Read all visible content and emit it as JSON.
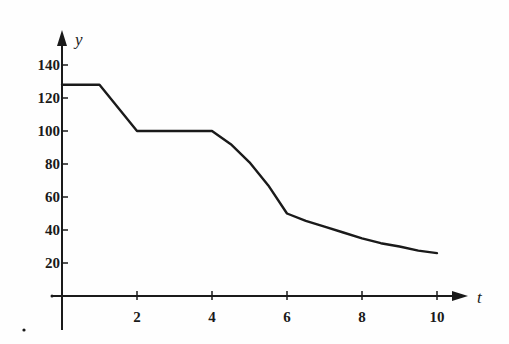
{
  "chart_data": {
    "type": "line",
    "title": "",
    "xlabel": "t",
    "ylabel": "y",
    "xlim": [
      0,
      10.5
    ],
    "ylim": [
      0,
      150
    ],
    "grid": false,
    "legend": null,
    "x_ticks": [
      2,
      4,
      6,
      8,
      10
    ],
    "y_ticks": [
      20,
      40,
      60,
      80,
      100,
      120,
      140
    ],
    "x_tick_labels": [
      "2",
      "4",
      "6",
      "8",
      "10"
    ],
    "y_tick_labels": [
      "20",
      "40",
      "60",
      "80",
      "100",
      "120",
      "140"
    ],
    "series": [
      {
        "name": "y(t)",
        "color": "#1a1a1a",
        "points": [
          [
            0,
            128
          ],
          [
            1,
            128
          ],
          [
            2,
            100
          ],
          [
            4,
            100
          ],
          [
            4.5,
            92
          ],
          [
            5,
            81
          ],
          [
            5.5,
            67
          ],
          [
            6,
            50
          ],
          [
            6.5,
            45.5
          ],
          [
            7,
            42
          ],
          [
            7.5,
            38.5
          ],
          [
            8,
            35
          ],
          [
            8.5,
            32
          ],
          [
            9,
            30
          ],
          [
            9.5,
            27.5
          ],
          [
            10,
            26
          ]
        ]
      }
    ]
  },
  "labels": {
    "x_axis": "t",
    "y_axis": "y"
  }
}
